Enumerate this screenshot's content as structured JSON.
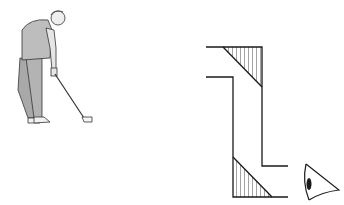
{
  "figure": {
    "left_panel": {
      "subject": "golfer",
      "items": [
        "golfer",
        "golf-club",
        "golf-ball"
      ]
    },
    "right_panel": {
      "subject": "periscope",
      "items": [
        "upper-mirror",
        "lower-mirror",
        "eye"
      ]
    },
    "colors": {
      "line": "#1a1a1a",
      "shirt": "#bdbdbd",
      "trousers": "#a9a9a9",
      "skin": "#eeeeee",
      "background": "#ffffff"
    }
  }
}
